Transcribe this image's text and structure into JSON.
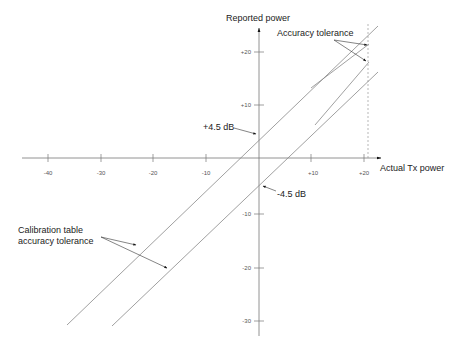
{
  "diagram": {
    "y_axis_label": "Reported power",
    "x_axis_label": "Actual Tx power",
    "x_ticks": [
      "-40",
      "-30",
      "-20",
      "-10",
      "+10",
      "+20"
    ],
    "y_ticks": [
      "+20",
      "+10",
      "-10",
      "-20",
      "-30"
    ],
    "annotations": {
      "upper_offset": "+4.5 dB",
      "lower_offset": "-4.5 dB",
      "accuracy_tolerance": "Accuracy tolerance",
      "calibration_line1": "Calibration table",
      "calibration_line2": "accuracy tolerance"
    },
    "colors": {
      "line": "#888888",
      "axis": "#777777",
      "text": "#222222"
    }
  }
}
